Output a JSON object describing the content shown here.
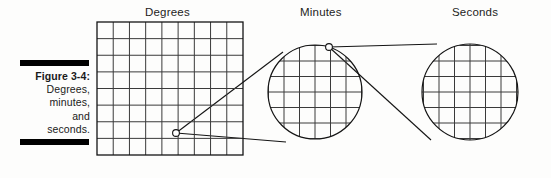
{
  "figure": {
    "caption_title": "Figure 3-4:",
    "caption_lines": [
      "Degrees,",
      "minutes,",
      "and",
      "seconds."
    ],
    "ink_color": "#1a1a1a",
    "rule_color": "#000000",
    "background_color": "#fdfdfc"
  },
  "panels": {
    "degrees": {
      "label": "Degrees",
      "shape": "rectangle",
      "columns": 9,
      "rows": 8,
      "x": 97,
      "y": 22,
      "width": 146,
      "height": 133,
      "grid_color": "#3a3a3a",
      "border_color": "#141414"
    },
    "minutes": {
      "label": "Minutes",
      "shape": "circle",
      "center_x": 315,
      "center_y": 92,
      "radius": 47,
      "grid_step": 15.5,
      "grid_color": "#3a3a3a",
      "border_color": "#141414"
    },
    "seconds": {
      "label": "Seconds",
      "shape": "circle",
      "center_x": 470,
      "center_y": 92,
      "radius": 48,
      "grid_step": 15.5,
      "grid_color": "#3a3a3a",
      "border_color": "#141414"
    }
  },
  "callouts": [
    {
      "name": "degrees-to-minutes",
      "origin_x": 176,
      "origin_y": 133,
      "origin_marker_radius": 3.4,
      "target_upper_x": 283,
      "target_upper_y": 52,
      "target_lower_x": 286,
      "target_lower_y": 142
    },
    {
      "name": "minutes-to-seconds",
      "origin_x": 329,
      "origin_y": 47,
      "origin_marker_radius": 3.4,
      "target_upper_x": 437,
      "target_upper_y": 44,
      "target_lower_x": 431,
      "target_lower_y": 140
    }
  ]
}
